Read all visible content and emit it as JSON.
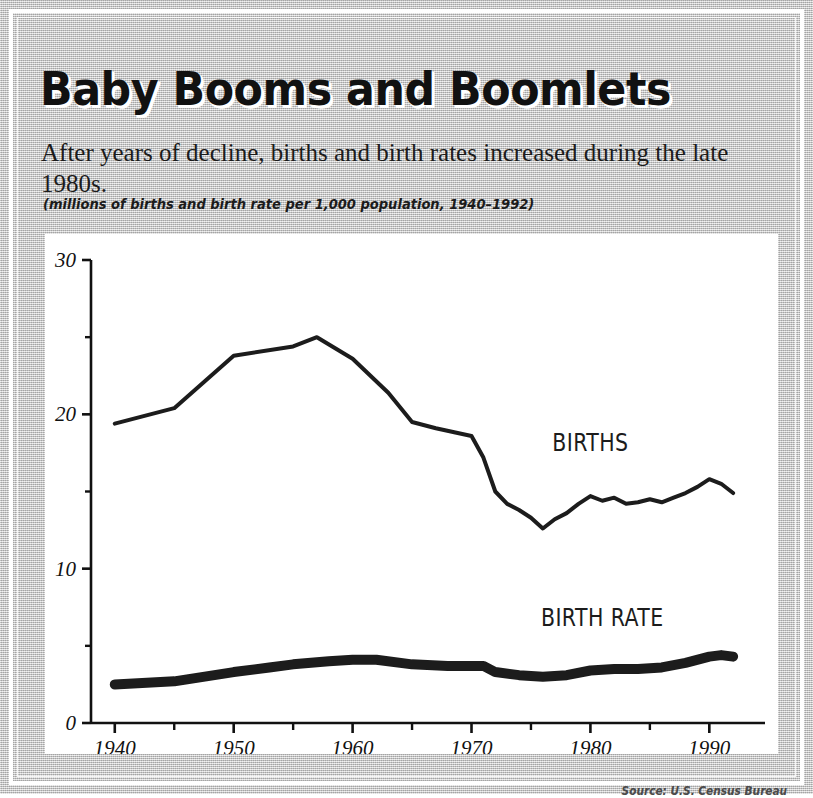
{
  "figure": {
    "title": "Baby Booms and Boomlets",
    "subtitle": "After years of decline, births and birth rates increased during the late 1980s.",
    "units_caption": "(millions of births and birth rate per 1,000 population, 1940–1992)",
    "source_credit": "Source: U.S. Census Bureau"
  },
  "chart_data": {
    "type": "line",
    "title": "Baby Booms and Boomlets",
    "subtitle": "After years of decline, births and birth rates increased during the late 1980s.",
    "xlabel": "",
    "ylabel": "",
    "units_note": "millions of births and birth rate per 1,000 population, 1940–1992",
    "xlim": [
      1938,
      1993
    ],
    "ylim": [
      0,
      30
    ],
    "x_major_ticks": [
      1940,
      1950,
      1960,
      1970,
      1980,
      1990
    ],
    "x_minor_ticks": [
      1945,
      1955,
      1965,
      1975,
      1985
    ],
    "x_tick_labels": [
      "1940",
      "1950",
      "1960",
      "1970",
      "1980",
      "1990"
    ],
    "y_major_ticks": [
      0,
      10,
      20,
      30
    ],
    "y_minor_ticks": [
      5,
      15,
      25
    ],
    "y_tick_labels": [
      "0",
      "10",
      "20",
      "30"
    ],
    "grid": false,
    "legend": "inline-labels",
    "annotations": [
      {
        "text": "BIRTHS",
        "x": 1980,
        "y": 17.6
      },
      {
        "text": "BIRTH RATE",
        "x": 1981,
        "y": 6.3
      }
    ],
    "series": [
      {
        "name": "BIRTHS",
        "label": "BIRTHS",
        "units": "millions",
        "line_width_px": 4,
        "color": "#1c1c1c",
        "x": [
          1940,
          1945,
          1950,
          1955,
          1957,
          1960,
          1963,
          1965,
          1967,
          1970,
          1971,
          1972,
          1973,
          1974,
          1975,
          1976,
          1977,
          1978,
          1979,
          1980,
          1981,
          1982,
          1983,
          1984,
          1985,
          1986,
          1987,
          1988,
          1989,
          1990,
          1991,
          1992
        ],
        "values": [
          19.4,
          20.4,
          23.8,
          24.4,
          25.0,
          23.6,
          21.4,
          19.5,
          19.1,
          18.6,
          17.2,
          15.0,
          14.2,
          13.8,
          13.3,
          12.6,
          13.2,
          13.6,
          14.2,
          14.7,
          14.4,
          14.6,
          14.2,
          14.3,
          14.5,
          14.3,
          14.6,
          14.9,
          15.3,
          15.8,
          15.5,
          14.9
        ]
      },
      {
        "name": "BIRTH RATE",
        "label": "BIRTH RATE",
        "units": "per 1,000 population",
        "line_width_px": 10,
        "color": "#1c1c1c",
        "x": [
          1940,
          1945,
          1950,
          1953,
          1955,
          1958,
          1960,
          1962,
          1965,
          1968,
          1970,
          1971,
          1972,
          1974,
          1976,
          1978,
          1980,
          1982,
          1984,
          1986,
          1988,
          1990,
          1991,
          1992
        ],
        "values": [
          2.5,
          2.7,
          3.3,
          3.6,
          3.8,
          4.0,
          4.1,
          4.1,
          3.8,
          3.7,
          3.7,
          3.7,
          3.3,
          3.1,
          3.0,
          3.1,
          3.4,
          3.5,
          3.5,
          3.6,
          3.9,
          4.3,
          4.4,
          4.3
        ]
      }
    ]
  }
}
